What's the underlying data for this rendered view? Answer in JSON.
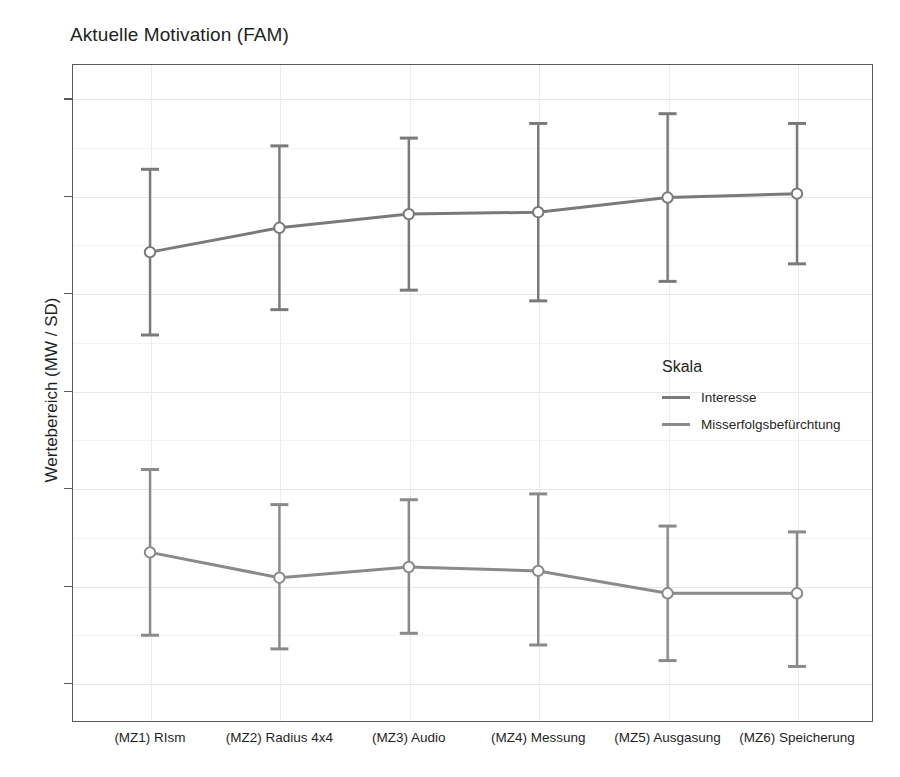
{
  "chart_data": {
    "type": "line",
    "title": "Aktuelle Motivation (FAM)",
    "xlabel": "",
    "ylabel": "Wertebereich (MW / SD)",
    "ylim": [
      0.6,
      7.35
    ],
    "yticks": [
      1,
      2,
      3,
      4,
      5,
      6,
      7
    ],
    "ytick_labels": [
      "1",
      "2",
      "3",
      "4",
      "5",
      "6",
      "7"
    ],
    "grid": true,
    "legend_position": "inside-right",
    "legend_title": "Skala",
    "categories": [
      "(MZ1) RIsm",
      "(MZ2) Radius 4x4",
      "(MZ3) Audio",
      "(MZ4) Messung",
      "(MZ5) Ausgasung",
      "(MZ6) Speicherung"
    ],
    "series": [
      {
        "name": "Interesse",
        "color": "#7a7a7a",
        "values": [
          5.42,
          5.67,
          5.81,
          5.83,
          5.98,
          6.02
        ],
        "err_low": [
          4.57,
          4.83,
          5.03,
          4.92,
          5.12,
          5.3
        ],
        "err_high": [
          6.27,
          6.51,
          6.59,
          6.74,
          6.84,
          6.74
        ]
      },
      {
        "name": "Misserfolgsbefürchtung",
        "color": "#8a8a8a",
        "values": [
          2.34,
          2.08,
          2.19,
          2.15,
          1.92,
          1.92
        ],
        "err_low": [
          1.49,
          1.35,
          1.51,
          1.39,
          1.23,
          1.17
        ],
        "err_high": [
          3.19,
          2.83,
          2.88,
          2.94,
          2.61,
          2.55
        ]
      }
    ]
  },
  "legend": {
    "title": "Skala",
    "entries": [
      {
        "label": "Interesse"
      },
      {
        "label": "Misserfolgsbefürchtung"
      }
    ]
  }
}
